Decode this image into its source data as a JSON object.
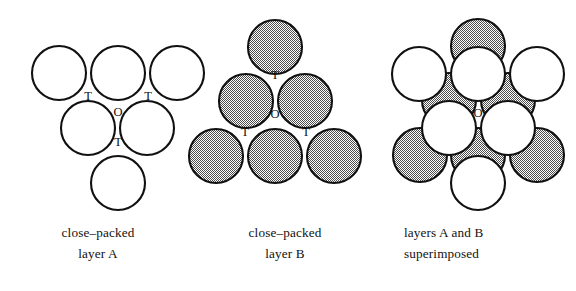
{
  "figure": {
    "stipple_gray": "#9a9a9a",
    "outline_color": "#111111",
    "background": "#ffffff"
  },
  "panels": [
    {
      "id": "layer-a",
      "caption_lines": [
        "close–packed",
        "layer A"
      ],
      "caption_align": "center",
      "sphere_fill": "white",
      "radius": 27,
      "spheres": [
        {
          "name": "sphere-a-top-left",
          "cx": 59,
          "cy": 73
        },
        {
          "name": "sphere-a-top-center",
          "cx": 118,
          "cy": 73
        },
        {
          "name": "sphere-a-top-right",
          "cx": 177,
          "cy": 73
        },
        {
          "name": "sphere-a-middle-left",
          "cx": 88,
          "cy": 128
        },
        {
          "name": "sphere-a-middle-right",
          "cx": 147,
          "cy": 128
        },
        {
          "name": "sphere-a-bottom",
          "cx": 118,
          "cy": 183
        }
      ],
      "site_labels": [
        {
          "name": "site-label-t-upper-left",
          "text": "T",
          "x": 88,
          "y": 97
        },
        {
          "name": "site-label-t-upper-right",
          "text": "T",
          "x": 148,
          "y": 97
        },
        {
          "name": "site-label-o-center",
          "text": "O",
          "x": 118,
          "y": 113
        },
        {
          "name": "site-label-t-lower",
          "text": "T",
          "x": 118,
          "y": 143
        }
      ]
    },
    {
      "id": "layer-b",
      "caption_lines": [
        "close–packed",
        "layer B"
      ],
      "caption_align": "center",
      "sphere_fill": "gray",
      "radius": 27,
      "spheres": [
        {
          "name": "sphere-b-top",
          "cx": 275,
          "cy": 47
        },
        {
          "name": "sphere-b-middle-left",
          "cx": 246,
          "cy": 101
        },
        {
          "name": "sphere-b-middle-right",
          "cx": 305,
          "cy": 101
        },
        {
          "name": "sphere-b-bottom-left",
          "cx": 216,
          "cy": 156
        },
        {
          "name": "sphere-b-bottom-center",
          "cx": 275,
          "cy": 156
        },
        {
          "name": "sphere-b-bottom-right",
          "cx": 334,
          "cy": 156
        }
      ],
      "site_labels": [
        {
          "name": "site-label-t-upper",
          "text": "T",
          "x": 275,
          "y": 76
        },
        {
          "name": "site-label-o-center",
          "text": "O",
          "x": 275,
          "y": 115
        },
        {
          "name": "site-label-t-lower-left",
          "text": "T",
          "x": 245,
          "y": 133
        },
        {
          "name": "site-label-t-lower-right",
          "text": "T",
          "x": 306,
          "y": 133
        }
      ]
    },
    {
      "id": "layers-superimposed",
      "caption_lines": [
        "layers A and B",
        "superimposed"
      ],
      "caption_align": "left",
      "sphere_fill": "mixed",
      "radius": 27,
      "spheres_back": [
        {
          "name": "sphere-b-top",
          "cx": 478,
          "cy": 46
        },
        {
          "name": "sphere-b-middle-left",
          "cx": 449,
          "cy": 100
        },
        {
          "name": "sphere-b-middle-right",
          "cx": 508,
          "cy": 100
        },
        {
          "name": "sphere-b-bottom-left",
          "cx": 420,
          "cy": 155
        },
        {
          "name": "sphere-b-bottom-center",
          "cx": 478,
          "cy": 155
        },
        {
          "name": "sphere-b-bottom-right",
          "cx": 537,
          "cy": 155
        }
      ],
      "spheres_front": [
        {
          "name": "sphere-a-top-left",
          "cx": 419,
          "cy": 74
        },
        {
          "name": "sphere-a-top-center",
          "cx": 478,
          "cy": 74
        },
        {
          "name": "sphere-a-top-right",
          "cx": 537,
          "cy": 74
        },
        {
          "name": "sphere-a-middle-left",
          "cx": 449,
          "cy": 128
        },
        {
          "name": "sphere-a-middle-right",
          "cx": 508,
          "cy": 128
        },
        {
          "name": "sphere-a-bottom",
          "cx": 478,
          "cy": 183
        }
      ],
      "site_labels": [
        {
          "name": "site-label-o-center",
          "text": "O",
          "x": 478,
          "y": 114
        }
      ]
    }
  ]
}
